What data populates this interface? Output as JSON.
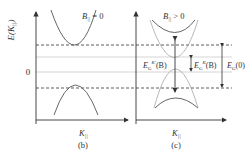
{
  "panels": [
    {
      "id": "b",
      "caption": "(b)",
      "condition_label_main": "B",
      "condition_label_sub": "||",
      "condition_label_rest": " = 0",
      "x_axis_label_main": "K",
      "x_axis_label_sub": "||"
    },
    {
      "id": "c",
      "caption": "(c)",
      "condition_label_main": "B",
      "condition_label_sub": "||",
      "condition_label_rest": " > 0",
      "x_axis_label_main": "K",
      "x_axis_label_sub": "||",
      "annotations": {
        "gap_k_prime": {
          "main": "E",
          "sub": "G",
          "sup": "K'",
          "rest": "(B)"
        },
        "gap_k": {
          "main": "E",
          "sub": "G",
          "sup": "K",
          "rest": "(B)"
        },
        "gap_zero": {
          "main": "E",
          "sub": "G",
          "rest": "(0)"
        }
      }
    }
  ],
  "y_axis": {
    "label_main": "E(K",
    "label_sub": "||",
    "label_rest": ")",
    "zero_tick": "0"
  },
  "colors": {
    "line": "#333333",
    "light_line": "#999999",
    "dashed": "#333333",
    "dotted": "#aaaaaa"
  }
}
